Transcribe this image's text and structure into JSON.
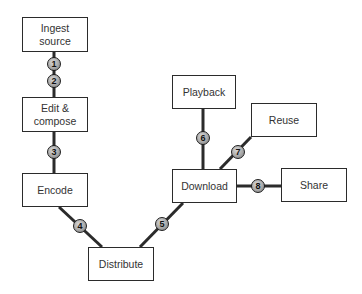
{
  "diagram": {
    "colors": {
      "line": "#2b2b2b",
      "box_border": "#2b2b2b",
      "badge_fill": "#a8a8a8",
      "text": "#333333"
    },
    "nodes": [
      {
        "id": "ingest",
        "label": "Ingest\nsource",
        "x": 22,
        "y": 17,
        "w": 66,
        "h": 35
      },
      {
        "id": "edit",
        "label": "Edit &\ncompose",
        "x": 22,
        "y": 97,
        "w": 66,
        "h": 35
      },
      {
        "id": "encode",
        "label": "Encode",
        "x": 22,
        "y": 173,
        "w": 66,
        "h": 34
      },
      {
        "id": "distribute",
        "label": "Distribute",
        "x": 88,
        "y": 247,
        "w": 66,
        "h": 34
      },
      {
        "id": "download",
        "label": "Download",
        "x": 172,
        "y": 169,
        "w": 65,
        "h": 34
      },
      {
        "id": "playback",
        "label": "Playback",
        "x": 172,
        "y": 75,
        "w": 64,
        "h": 34
      },
      {
        "id": "reuse",
        "label": "Reuse",
        "x": 251,
        "y": 103,
        "w": 66,
        "h": 34
      },
      {
        "id": "share",
        "label": "Share",
        "x": 281,
        "y": 168,
        "w": 66,
        "h": 34
      }
    ],
    "edges": [
      {
        "from": "ingest",
        "to": "edit",
        "x1": 54,
        "y1": 52,
        "x2": 54,
        "y2": 97
      },
      {
        "from": "edit",
        "to": "encode",
        "x1": 54,
        "y1": 132,
        "x2": 54,
        "y2": 173
      },
      {
        "from": "encode",
        "to": "distribute",
        "x1": 59,
        "y1": 207,
        "x2": 102,
        "y2": 247
      },
      {
        "from": "distribute",
        "to": "download",
        "x1": 140,
        "y1": 247,
        "x2": 183,
        "y2": 203
      },
      {
        "from": "download",
        "to": "playback",
        "x1": 203,
        "y1": 109,
        "x2": 203,
        "y2": 169
      },
      {
        "from": "download",
        "to": "reuse",
        "x1": 220,
        "y1": 169,
        "x2": 251,
        "y2": 137
      },
      {
        "from": "download",
        "to": "share",
        "x1": 237,
        "y1": 186,
        "x2": 281,
        "y2": 186
      }
    ],
    "badges": [
      {
        "label": "1",
        "x": 54,
        "y": 64
      },
      {
        "label": "2",
        "x": 54,
        "y": 81
      },
      {
        "label": "3",
        "x": 54,
        "y": 152
      },
      {
        "label": "4",
        "x": 80,
        "y": 226
      },
      {
        "label": "5",
        "x": 162,
        "y": 224
      },
      {
        "label": "6",
        "x": 203,
        "y": 138
      },
      {
        "label": "7",
        "x": 238,
        "y": 152
      },
      {
        "label": "8",
        "x": 258,
        "y": 186
      }
    ]
  }
}
